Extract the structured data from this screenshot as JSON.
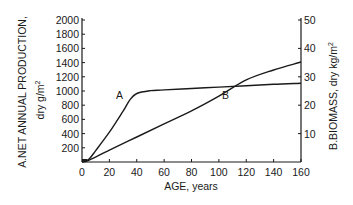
{
  "chart_data": {
    "type": "line",
    "title": "",
    "xlabel": "AGE, years",
    "ylabel": "A.NET ANNUAL PRODUCTION, dry g/m2",
    "ylabel_line1": "A.NET ANNUAL PRODUCTION,",
    "ylabel_line2": "dry g/m",
    "ylabel_sup": "2",
    "y2label": "B.BIOMASS, dry kg/m2",
    "y2label_main": "B.BIOMASS, dry kg/m",
    "y2label_sup": "2",
    "xlim": [
      0,
      160
    ],
    "ylim": [
      0,
      2000
    ],
    "y2lim": [
      0,
      50
    ],
    "x_ticks": [
      "0",
      "20",
      "40",
      "60",
      "80",
      "100",
      "120",
      "140",
      "160"
    ],
    "y_ticks": [
      "200",
      "400",
      "600",
      "800",
      "1000",
      "1200",
      "1400",
      "1600",
      "1800",
      "2000"
    ],
    "y2_ticks": [
      "10",
      "20",
      "30",
      "40",
      "50"
    ],
    "grid": false,
    "series": [
      {
        "name": "A",
        "axis": "left",
        "label": "A",
        "x": [
          0,
          5,
          10,
          20,
          30,
          35,
          40,
          50,
          60,
          80,
          100,
          120,
          140,
          160
        ],
        "values": [
          0,
          40,
          160,
          420,
          715,
          875,
          965,
          1005,
          1015,
          1035,
          1055,
          1075,
          1095,
          1110
        ]
      },
      {
        "name": "B",
        "axis": "right",
        "label": "B",
        "x": [
          0,
          5,
          20,
          40,
          60,
          80,
          100,
          120,
          140,
          160
        ],
        "values": [
          0,
          0.6,
          4.2,
          8.8,
          13.4,
          18.0,
          23.2,
          28.9,
          32.4,
          35.2
        ]
      }
    ],
    "annotations": [
      {
        "text": "A",
        "x": 28,
        "y": 1000
      },
      {
        "text": "B",
        "x": 106,
        "y": 1000
      }
    ]
  }
}
